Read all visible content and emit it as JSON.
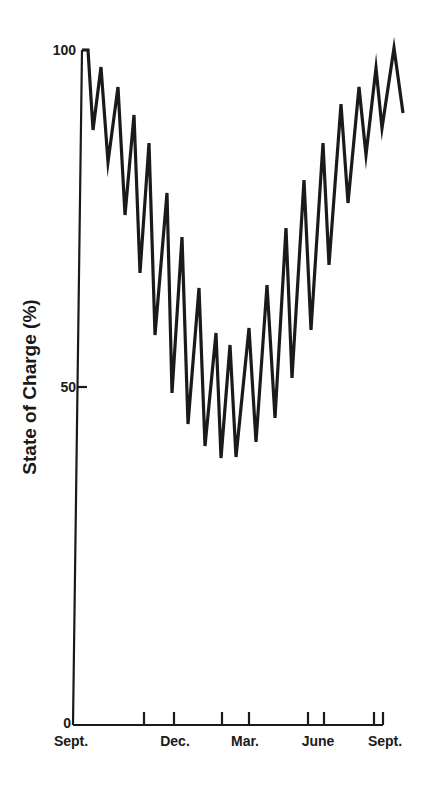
{
  "chart_data": {
    "type": "line",
    "title": "",
    "xlabel": "",
    "ylabel": "State of Charge (%)",
    "ylim": [
      0,
      100
    ],
    "yticks": [
      0,
      50,
      100
    ],
    "xtick_labels": [
      "Sept.",
      "Dec.",
      "Mar.",
      "June",
      "Sept."
    ],
    "xlim_months": [
      0,
      12.3
    ],
    "grid": false,
    "legend": null,
    "series": [
      {
        "name": "State of Charge",
        "x_months": [
          0.2,
          0.4,
          0.6,
          0.9,
          1.1,
          1.4,
          1.6,
          1.9,
          2.1,
          2.4,
          2.6,
          3.0,
          3.2,
          3.5,
          3.7,
          4.1,
          4.3,
          4.6,
          4.8,
          5.2,
          5.4,
          5.9,
          6.1,
          6.5,
          6.7,
          7.1,
          7.3,
          7.7,
          7.9,
          8.3,
          8.5,
          8.9,
          9.1,
          9.5,
          9.7,
          10.1,
          10.3,
          10.7,
          10.9,
          11.3,
          11.5
        ],
        "values": [
          100,
          100,
          88,
          97,
          83,
          94,
          75,
          90,
          67,
          86,
          58,
          78,
          49,
          72,
          45,
          65,
          42,
          58,
          40,
          56,
          40,
          58,
          42,
          65,
          45,
          73,
          51,
          80,
          58,
          86,
          68,
          91,
          77,
          94,
          84,
          97,
          88,
          100,
          90
        ],
        "note": "Seasonal decline from 100% in Sept. to ~40% around Feb./Mar., then recovery to ~100% by Sept.; daily/weekly charge-discharge oscillations superimposed."
      }
    ],
    "points_px": [
      [
        82,
        50
      ],
      [
        88,
        50
      ],
      [
        93,
        130
      ],
      [
        101,
        67
      ],
      [
        108,
        162
      ],
      [
        118,
        87
      ],
      [
        125,
        215
      ],
      [
        134,
        115
      ],
      [
        140,
        273
      ],
      [
        149,
        143
      ],
      [
        155,
        335
      ],
      [
        167,
        193
      ],
      [
        172,
        393
      ],
      [
        182,
        237
      ],
      [
        188,
        424
      ],
      [
        199,
        288
      ],
      [
        205,
        446
      ],
      [
        216,
        333
      ],
      [
        221,
        458
      ],
      [
        230,
        345
      ],
      [
        236,
        457
      ],
      [
        249,
        328
      ],
      [
        256,
        442
      ],
      [
        267,
        285
      ],
      [
        275,
        418
      ],
      [
        286,
        228
      ],
      [
        292,
        378
      ],
      [
        304,
        180
      ],
      [
        311,
        330
      ],
      [
        323,
        143
      ],
      [
        329,
        265
      ],
      [
        341,
        104
      ],
      [
        348,
        203
      ],
      [
        359,
        87
      ],
      [
        366,
        155
      ],
      [
        376,
        68
      ],
      [
        382,
        128
      ],
      [
        394,
        48
      ],
      [
        403,
        113
      ]
    ],
    "tick_marks_px_x": [
      144,
      174,
      222,
      249,
      308,
      324,
      374,
      383
    ]
  },
  "labels": {
    "ylabel": "State of Charge (%)",
    "y100": "100",
    "y50": "50",
    "y0": "0",
    "x_sept_start": "Sept.",
    "x_dec": "Dec.",
    "x_mar": "Mar.",
    "x_june": "June",
    "x_sept_end": "Sept."
  }
}
